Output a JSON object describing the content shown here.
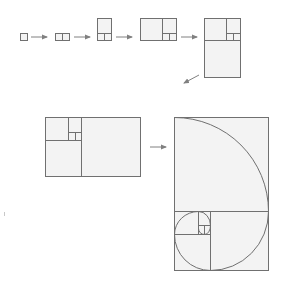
{
  "diagram": {
    "colors": {
      "stroke": "#707070",
      "fill": "#f3f3f3",
      "arrow": "#808080",
      "background": "#ffffff"
    },
    "steps": [
      {
        "id": "step-1",
        "label": "1x1",
        "description": "single unit square"
      },
      {
        "id": "step-2",
        "label": "2x1",
        "description": "two unit squares side by side"
      },
      {
        "id": "step-3",
        "label": "2x3",
        "description": "2x2 square added on top"
      },
      {
        "id": "step-4",
        "label": "5x3",
        "description": "3x3 square added on left"
      },
      {
        "id": "step-5",
        "label": "5x8",
        "description": "5x5 square added on bottom"
      },
      {
        "id": "step-6",
        "label": "8x5",
        "description": "rotated arrangement with 5x5 square"
      },
      {
        "id": "step-7",
        "label": "8x13",
        "description": "8x8 square added with golden spiral drawn"
      }
    ],
    "fibonacci_sequence": [
      1,
      1,
      2,
      3,
      5,
      8,
      13
    ],
    "arrows": 6
  }
}
